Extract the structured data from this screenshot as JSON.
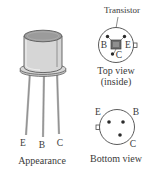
{
  "figure": {
    "title_callout": "Transistor",
    "appearance": {
      "caption": "Appearance",
      "pins": [
        "E",
        "B",
        "C"
      ]
    },
    "top_view": {
      "caption_line1": "Top view",
      "caption_line2": "(inside)",
      "pins": [
        "B",
        "E",
        "C"
      ],
      "die_label": "transistor-die"
    },
    "bottom_view": {
      "caption": "Bottom view",
      "pins": [
        "E",
        "B",
        "C"
      ]
    },
    "colors": {
      "can_body": "#d3d3d3",
      "can_top": "#9a9a9a",
      "outline": "#4a4a4a",
      "lead": "#b8b8b8",
      "die": "#6e6e6e",
      "text": "#3a3a3a",
      "background": "#ffffff"
    }
  }
}
